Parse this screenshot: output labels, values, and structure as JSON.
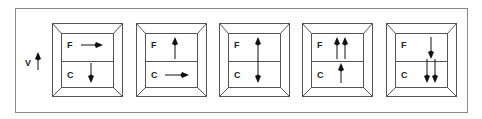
{
  "legend": {
    "label": "V",
    "arrow": "up"
  },
  "panels": [
    {
      "top_label": "F",
      "bottom_label": "C",
      "top_arrows": [
        "right"
      ],
      "bottom_arrows": [
        "down"
      ]
    },
    {
      "top_label": "F",
      "bottom_label": "C",
      "top_arrows": [
        "up"
      ],
      "bottom_arrows": [
        "right"
      ]
    },
    {
      "top_label": "F",
      "bottom_label": "C",
      "top_arrows": [
        "up-across"
      ],
      "bottom_arrows": []
    },
    {
      "top_label": "F",
      "bottom_label": "C",
      "top_arrows": [
        "up",
        "up"
      ],
      "bottom_arrows": [
        "up"
      ]
    },
    {
      "top_label": "F",
      "bottom_label": "C",
      "top_arrows": [
        "down"
      ],
      "bottom_arrows": [
        "down",
        "down"
      ]
    }
  ],
  "colors": {
    "line": "#555555",
    "arrow": "#111111",
    "frame": "#888888"
  }
}
